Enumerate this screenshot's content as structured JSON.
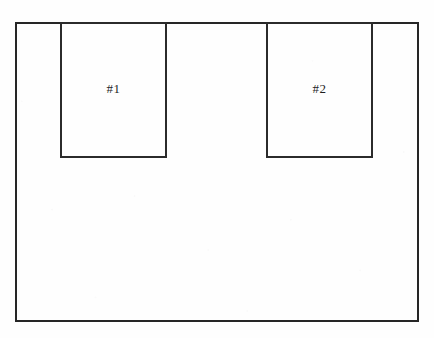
{
  "figure": {
    "background_color": "#fefefe",
    "line_color": "#262626",
    "label_color": "#1e1e1e",
    "outer": {
      "name": "outer-rectangle"
    },
    "boxes": [
      {
        "label": "#1",
        "name": "inner-box-1"
      },
      {
        "label": "#2",
        "name": "inner-box-2"
      }
    ]
  }
}
